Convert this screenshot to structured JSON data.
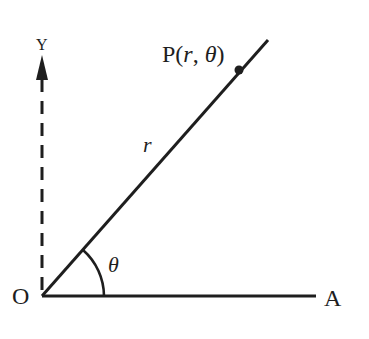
{
  "diagram": {
    "type": "polar-coordinates",
    "colors": {
      "ink": "#1e1e1e",
      "background": "#ffffff"
    },
    "labels": {
      "origin": "O",
      "axis_end": "A",
      "vertical_axis": "Y",
      "point_prefix": "P(",
      "point_r": "r",
      "point_sep": ", ",
      "point_theta": "θ",
      "point_suffix": ")",
      "radius": "r",
      "angle": "θ"
    },
    "elements": [
      {
        "id": "polar-axis",
        "kind": "line",
        "from": "O",
        "to": "A"
      },
      {
        "id": "ray-OP",
        "kind": "line",
        "from": "O",
        "through": "P",
        "label": "r"
      },
      {
        "id": "vertical-axis",
        "kind": "dashed-arrow",
        "from": "O",
        "direction": "up"
      },
      {
        "id": "angle-arc",
        "kind": "arc",
        "between": [
          "polar-axis",
          "ray-OP"
        ],
        "label": "θ"
      },
      {
        "id": "point-P",
        "kind": "point",
        "label": "P(r, θ)"
      }
    ]
  }
}
